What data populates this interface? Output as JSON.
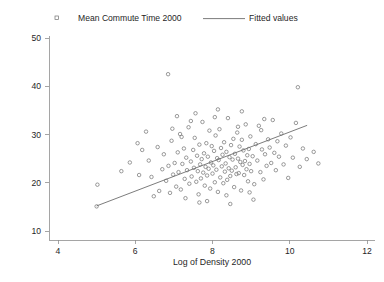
{
  "chart_data": {
    "type": "scatter",
    "title": "",
    "xlabel": "Log of Density 2000",
    "ylabel": "",
    "xlim": [
      4,
      12
    ],
    "ylim": [
      10,
      50
    ],
    "xticks": [
      4,
      6,
      8,
      10,
      12
    ],
    "yticks": [
      10,
      20,
      30,
      40,
      50
    ],
    "grid": false,
    "legend_position": "top",
    "legend": [
      {
        "label": "Mean Commute Time 2000",
        "marker": "open-circle"
      },
      {
        "label": "Fitted values",
        "marker": "line"
      }
    ],
    "series": [
      {
        "name": "Mean Commute Time 2000",
        "type": "scatter",
        "marker": "open-circle",
        "color": "#707070",
        "points": [
          [
            5.02,
            19.6
          ],
          [
            5.0,
            15.1
          ],
          [
            6.85,
            42.5
          ],
          [
            10.21,
            39.8
          ],
          [
            6.35,
            24.6
          ],
          [
            6.42,
            21.2
          ],
          [
            6.58,
            27.4
          ],
          [
            6.62,
            18.3
          ],
          [
            6.7,
            22.8
          ],
          [
            6.74,
            25.9
          ],
          [
            6.8,
            20.4
          ],
          [
            6.86,
            23.5
          ],
          [
            6.9,
            17.9
          ],
          [
            6.94,
            28.7
          ],
          [
            6.98,
            21.7
          ],
          [
            7.02,
            24.1
          ],
          [
            7.06,
            19.2
          ],
          [
            7.1,
            26.3
          ],
          [
            7.12,
            22.2
          ],
          [
            7.16,
            30.1
          ],
          [
            7.18,
            18.6
          ],
          [
            7.22,
            23.9
          ],
          [
            7.26,
            27.1
          ],
          [
            7.28,
            20.8
          ],
          [
            7.32,
            25.2
          ],
          [
            7.34,
            22.6
          ],
          [
            7.38,
            31.5
          ],
          [
            7.4,
            19.8
          ],
          [
            7.44,
            24.4
          ],
          [
            7.46,
            21.3
          ],
          [
            7.5,
            26.8
          ],
          [
            7.52,
            23.1
          ],
          [
            7.54,
            29.3
          ],
          [
            7.58,
            20.2
          ],
          [
            7.6,
            25.6
          ],
          [
            7.62,
            22.4
          ],
          [
            7.64,
            17.6
          ],
          [
            7.66,
            27.9
          ],
          [
            7.68,
            23.8
          ],
          [
            7.7,
            20.9
          ],
          [
            7.72,
            24.9
          ],
          [
            7.74,
            32.6
          ],
          [
            7.76,
            22.1
          ],
          [
            7.78,
            26.1
          ],
          [
            7.8,
            19.4
          ],
          [
            7.82,
            23.3
          ],
          [
            7.84,
            28.2
          ],
          [
            7.86,
            21.5
          ],
          [
            7.88,
            25.4
          ],
          [
            7.9,
            22.9
          ],
          [
            7.92,
            30.8
          ],
          [
            7.94,
            18.8
          ],
          [
            7.96,
            24.2
          ],
          [
            7.98,
            27.6
          ],
          [
            8.0,
            21.9
          ],
          [
            8.02,
            23.6
          ],
          [
            8.04,
            26.6
          ],
          [
            8.06,
            20.1
          ],
          [
            8.08,
            29.8
          ],
          [
            8.1,
            22.7
          ],
          [
            8.12,
            25.1
          ],
          [
            8.14,
            18.1
          ],
          [
            8.16,
            24.7
          ],
          [
            8.18,
            31.1
          ],
          [
            8.2,
            21.1
          ],
          [
            8.22,
            27.2
          ],
          [
            8.24,
            23.4
          ],
          [
            8.26,
            25.8
          ],
          [
            8.28,
            19.9
          ],
          [
            8.3,
            28.4
          ],
          [
            8.32,
            22.3
          ],
          [
            8.34,
            24.0
          ],
          [
            8.36,
            26.4
          ],
          [
            8.38,
            20.6
          ],
          [
            8.4,
            33.4
          ],
          [
            8.42,
            23.0
          ],
          [
            8.44,
            25.3
          ],
          [
            8.46,
            21.4
          ],
          [
            8.48,
            27.8
          ],
          [
            8.5,
            22.5
          ],
          [
            8.52,
            24.8
          ],
          [
            8.54,
            29.1
          ],
          [
            8.56,
            19.1
          ],
          [
            8.58,
            26.0
          ],
          [
            8.6,
            23.2
          ],
          [
            8.62,
            21.8
          ],
          [
            8.64,
            30.4
          ],
          [
            8.66,
            25.0
          ],
          [
            8.68,
            22.0
          ],
          [
            8.7,
            27.5
          ],
          [
            8.72,
            24.3
          ],
          [
            8.74,
            18.4
          ],
          [
            8.76,
            28.9
          ],
          [
            8.78,
            23.7
          ],
          [
            8.8,
            26.7
          ],
          [
            8.82,
            21.6
          ],
          [
            8.84,
            24.5
          ],
          [
            8.86,
            32.1
          ],
          [
            8.88,
            22.8
          ],
          [
            8.9,
            25.7
          ],
          [
            8.92,
            20.3
          ],
          [
            8.94,
            27.0
          ],
          [
            8.96,
            23.9
          ],
          [
            8.98,
            29.6
          ],
          [
            9.0,
            22.4
          ],
          [
            9.04,
            25.5
          ],
          [
            9.08,
            19.7
          ],
          [
            9.12,
            28.0
          ],
          [
            9.16,
            24.6
          ],
          [
            9.2,
            31.8
          ],
          [
            9.24,
            22.2
          ],
          [
            9.28,
            26.9
          ],
          [
            9.32,
            20.7
          ],
          [
            9.36,
            25.9
          ],
          [
            9.4,
            23.5
          ],
          [
            9.44,
            29.0
          ],
          [
            9.48,
            27.3
          ],
          [
            9.52,
            24.1
          ],
          [
            9.56,
            33.0
          ],
          [
            9.6,
            26.2
          ],
          [
            9.64,
            22.6
          ],
          [
            9.68,
            28.6
          ],
          [
            9.72,
            25.4
          ],
          [
            9.78,
            30.2
          ],
          [
            9.84,
            23.8
          ],
          [
            9.9,
            27.7
          ],
          [
            9.96,
            21.0
          ],
          [
            10.02,
            29.4
          ],
          [
            10.08,
            25.2
          ],
          [
            10.16,
            32.4
          ],
          [
            10.26,
            23.3
          ],
          [
            10.34,
            27.1
          ],
          [
            10.44,
            24.9
          ],
          [
            6.28,
            30.6
          ],
          [
            6.48,
            17.2
          ],
          [
            7.08,
            33.8
          ],
          [
            7.3,
            16.8
          ],
          [
            7.56,
            34.4
          ],
          [
            7.86,
            16.2
          ],
          [
            8.14,
            35.2
          ],
          [
            8.46,
            15.6
          ],
          [
            8.76,
            34.8
          ],
          [
            9.06,
            16.5
          ],
          [
            9.34,
            33.2
          ],
          [
            6.96,
            31.2
          ],
          [
            7.2,
            29.5
          ],
          [
            7.44,
            32.8
          ],
          [
            7.66,
            15.9
          ],
          [
            8.06,
            33.6
          ],
          [
            8.36,
            17.4
          ],
          [
            8.66,
            31.6
          ],
          [
            8.96,
            18.0
          ],
          [
            9.26,
            30.9
          ],
          [
            5.86,
            24.2
          ],
          [
            6.1,
            21.6
          ],
          [
            6.18,
            26.8
          ],
          [
            5.64,
            22.4
          ],
          [
            6.06,
            28.2
          ],
          [
            10.62,
            26.4
          ],
          [
            10.74,
            24.0
          ]
        ]
      },
      {
        "name": "Fitted values",
        "type": "line",
        "color": "#6d6d6d",
        "endpoints": [
          [
            5.0,
            15.2
          ],
          [
            10.45,
            31.9
          ]
        ]
      }
    ]
  }
}
